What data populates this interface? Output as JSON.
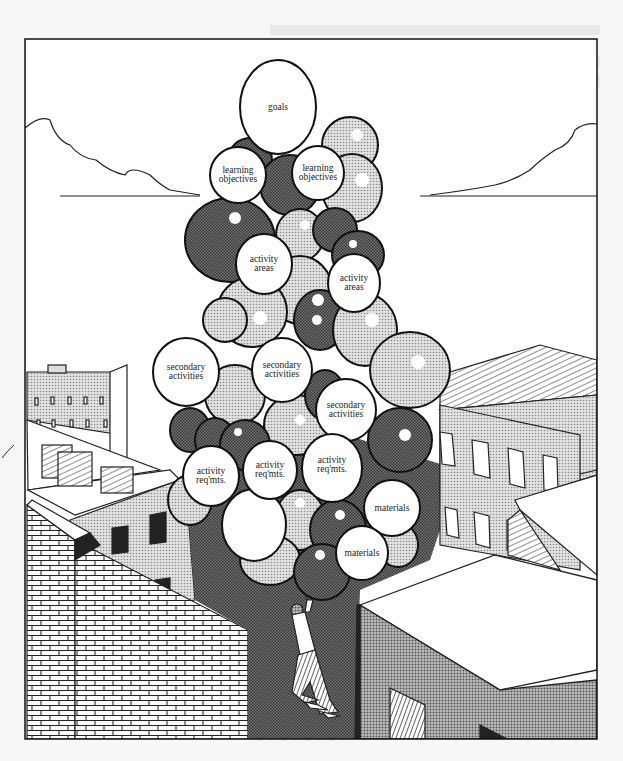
{
  "illustration": {
    "description": "Cartoon of a person hanging from a large cluster of balloons between city rooftops",
    "balloons": [
      {
        "id": "goals",
        "label": "goals",
        "x": 278,
        "y": 107,
        "rx": 38,
        "ry": 47
      },
      {
        "id": "lo1",
        "label": "learning\nobjectives",
        "x": 238,
        "y": 175,
        "rx": 28,
        "ry": 28
      },
      {
        "id": "lo2",
        "label": "learning\nobjectives",
        "x": 318,
        "y": 173,
        "rx": 26,
        "ry": 27
      },
      {
        "id": "aa1",
        "label": "activity\nareas",
        "x": 264,
        "y": 264,
        "rx": 28,
        "ry": 30
      },
      {
        "id": "aa2",
        "label": "activity\nareas",
        "x": 354,
        "y": 283,
        "rx": 26,
        "ry": 29
      },
      {
        "id": "sa1",
        "label": "secondary\nactivities",
        "x": 186,
        "y": 372,
        "rx": 33,
        "ry": 34
      },
      {
        "id": "sa2",
        "label": "secondary\nactivities",
        "x": 282,
        "y": 370,
        "rx": 30,
        "ry": 32
      },
      {
        "id": "sa3",
        "label": "secondary\nactivities",
        "x": 346,
        "y": 410,
        "rx": 30,
        "ry": 31
      },
      {
        "id": "ar1",
        "label": "activity\nreq'mts.",
        "x": 211,
        "y": 476,
        "rx": 28,
        "ry": 30
      },
      {
        "id": "ar2",
        "label": "activity\nreq'mts.",
        "x": 270,
        "y": 470,
        "rx": 27,
        "ry": 29
      },
      {
        "id": "ar3",
        "label": "activity\nreq'mts.",
        "x": 332,
        "y": 468,
        "rx": 30,
        "ry": 34
      },
      {
        "id": "mat1",
        "label": "materials",
        "x": 392,
        "y": 508,
        "rx": 28,
        "ry": 28
      },
      {
        "id": "mat2",
        "label": "materials",
        "x": 362,
        "y": 553,
        "rx": 26,
        "ry": 27
      }
    ],
    "colors": {
      "ink": "#1a1a1a",
      "paper": "#ffffff",
      "halftone_light": "#c9c9c9",
      "halftone_dark": "#6f6f6f",
      "background": "#f7f7f5"
    }
  }
}
